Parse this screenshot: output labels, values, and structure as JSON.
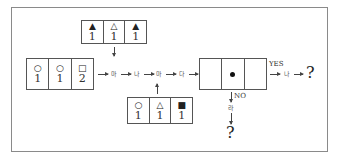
{
  "diagram": {
    "top_box": {
      "cells": [
        {
          "symbol": "▲",
          "value": "1"
        },
        {
          "symbol": "△",
          "value": "1"
        },
        {
          "symbol": "▲",
          "value": "1"
        }
      ]
    },
    "left_box": {
      "cells": [
        {
          "symbol": "○",
          "value": "1"
        },
        {
          "symbol": "○",
          "value": "1"
        },
        {
          "symbol": "□",
          "value": "2"
        }
      ]
    },
    "bottom_box": {
      "cells": [
        {
          "symbol": "○",
          "value": "1"
        },
        {
          "symbol": "△",
          "value": "1"
        },
        {
          "symbol": "■",
          "value": "1"
        }
      ]
    },
    "chain": [
      "마",
      "나",
      "마",
      "다"
    ],
    "middle_box": {
      "center_marker": "dot"
    },
    "yes_branch": {
      "label": "YES",
      "step": "나",
      "result": "?"
    },
    "no_branch": {
      "label": "NO",
      "step": "라",
      "result": "?"
    }
  }
}
